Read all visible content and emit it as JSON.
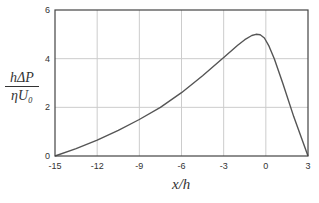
{
  "chart_data": {
    "type": "line",
    "title": "",
    "xlabel": "x/h",
    "ylabel_numerator": "hΔP",
    "ylabel_denominator": "ηU₀",
    "xlim": [
      -15,
      3
    ],
    "ylim": [
      0,
      6
    ],
    "xticks": [
      -15,
      -12,
      -9,
      -6,
      -3,
      0,
      3
    ],
    "yticks": [
      0,
      2,
      4,
      6
    ],
    "grid": true,
    "legend": null,
    "series": [
      {
        "name": "pressure",
        "color": "#555555",
        "x": [
          -15,
          -13.5,
          -12,
          -10.5,
          -9,
          -7.5,
          -6,
          -4.5,
          -3,
          -2,
          -1.5,
          -1,
          -0.7,
          -0.4,
          -0.1,
          0.2,
          0.6,
          1.2,
          2,
          3
        ],
        "y": [
          0,
          0.3,
          0.65,
          1.05,
          1.5,
          2.0,
          2.6,
          3.3,
          4.05,
          4.55,
          4.78,
          4.95,
          5.0,
          4.98,
          4.85,
          4.55,
          4.0,
          3.0,
          1.6,
          0
        ]
      }
    ]
  },
  "colors": {
    "axis": "#444444",
    "grid": "#cccccc",
    "line": "#555555"
  }
}
